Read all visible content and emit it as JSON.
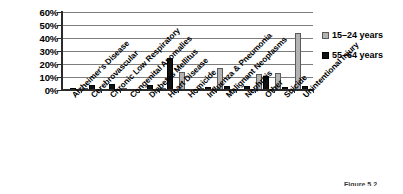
{
  "chart_data": {
    "type": "bar",
    "title": "",
    "xlabel": "",
    "ylabel": "",
    "ylim": [
      0,
      60
    ],
    "ytick_labels": [
      "60%",
      "50%",
      "40%",
      "30%",
      "20%",
      "10%",
      "0%"
    ],
    "ytick_values": [
      60,
      50,
      40,
      30,
      20,
      10,
      0
    ],
    "grid": true,
    "legend_position": "right",
    "categories": [
      "Alzheimer's Disease",
      "Cerebrovascular",
      "Chronic Low Respiratory",
      "Congenital Anomalies",
      "Diabetes Mellitus",
      "Heart Disease",
      "Homicide",
      "Influenza & Pneumonia",
      "Malignant Neoplasms",
      "Nephritis",
      "Other",
      "Suicide",
      "Unintentional Injury"
    ],
    "series": [
      {
        "name": "15–24 years",
        "color": "#b3b3b3",
        "values": [
          0,
          0.5,
          0,
          1.5,
          0,
          1,
          14,
          0.5,
          17,
          0,
          12,
          13,
          44
        ]
      },
      {
        "name": "55–64 years",
        "color": "#111111",
        "values": [
          0.5,
          4,
          5,
          0,
          4,
          25,
          0,
          2,
          3,
          3,
          11,
          2,
          3
        ]
      }
    ]
  },
  "legend": {
    "items": [
      {
        "label": "15–24 years",
        "swatch": "gray"
      },
      {
        "label": "55–64 years",
        "swatch": "black"
      }
    ]
  },
  "caption": {
    "text": "Figure 5.2"
  }
}
